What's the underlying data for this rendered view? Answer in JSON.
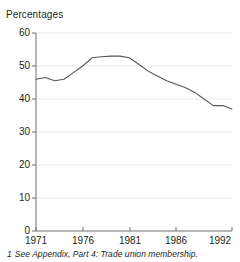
{
  "chart_data": {
    "type": "line",
    "title": "",
    "ylabel": "Percentages",
    "xlabel": "",
    "ylim": [
      0,
      60
    ],
    "xlim": [
      1971,
      1992
    ],
    "yticks": [
      0,
      10,
      20,
      30,
      40,
      50,
      60
    ],
    "xticks": [
      1971,
      1976,
      1981,
      1986,
      1992
    ],
    "grid": true,
    "legend": null,
    "series": [
      {
        "name": "Trade union membership",
        "color": "#55565a",
        "x": [
          1971,
          1972,
          1973,
          1974,
          1975,
          1976,
          1977,
          1978,
          1979,
          1980,
          1981,
          1982,
          1983,
          1984,
          1985,
          1986,
          1987,
          1988,
          1989,
          1990,
          1991,
          1992
        ],
        "values": [
          46.0,
          46.5,
          45.5,
          46.0,
          48.0,
          50.0,
          52.5,
          52.8,
          53.0,
          53.0,
          52.5,
          50.5,
          48.5,
          47.0,
          45.5,
          44.5,
          43.5,
          42.0,
          40.0,
          38.0,
          38.0,
          37.0
        ]
      }
    ]
  },
  "axis_title": "Percentages",
  "ytick_labels": [
    "60",
    "50",
    "40",
    "30",
    "20",
    "10",
    "0"
  ],
  "xtick_labels": [
    "1971",
    "1976",
    "1981",
    "1986",
    "1992"
  ],
  "footnote": {
    "marker": "1",
    "text": "See Appendix, Part 4: Trade union membership."
  },
  "colors": {
    "line": "#55565a",
    "grid": "#e8e8e8",
    "axis": "#6d6e71",
    "text": "#231f20"
  }
}
